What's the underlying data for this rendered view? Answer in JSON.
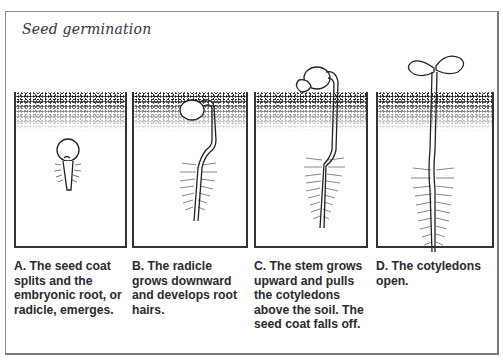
{
  "figure": {
    "title": "Seed germination",
    "colors": {
      "ink": "#222222",
      "frame": "#8a8a8a",
      "caption_text": "#2a2a2a",
      "background": "#ffffff"
    },
    "panels": [
      {
        "id": "A",
        "stage": "seed coat splits, radicle emerges",
        "caption": "A. The seed coat splits and the embryonic root, or radicle, emerges."
      },
      {
        "id": "B",
        "stage": "radicle grows downward with root hairs",
        "caption": "B. The radicle grows downward and develops root hairs."
      },
      {
        "id": "C",
        "stage": "stem pulls cotyledons above soil, seed coat falls off",
        "caption": "C. The stem grows upward and pulls the cotyledons above the soil. The seed coat falls off."
      },
      {
        "id": "D",
        "stage": "cotyledons open",
        "caption": "D. The cotyledons open."
      }
    ]
  }
}
